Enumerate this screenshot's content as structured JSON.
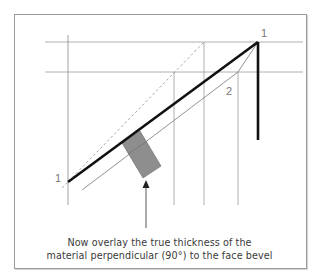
{
  "diagram": {
    "labels": {
      "top_right": "1",
      "bottom_left": "1",
      "inner": "2"
    },
    "caption": {
      "line1": "Now overlay the true thickness of the",
      "line2": "material perpendicular (90°) to the face bevel"
    },
    "colors": {
      "frame": "#9a9a9a",
      "guide_lines": "#8c8c8c",
      "bold_line": "#111111",
      "thickness_block": "#8e8e8e",
      "text": "#3a3a3a"
    }
  }
}
